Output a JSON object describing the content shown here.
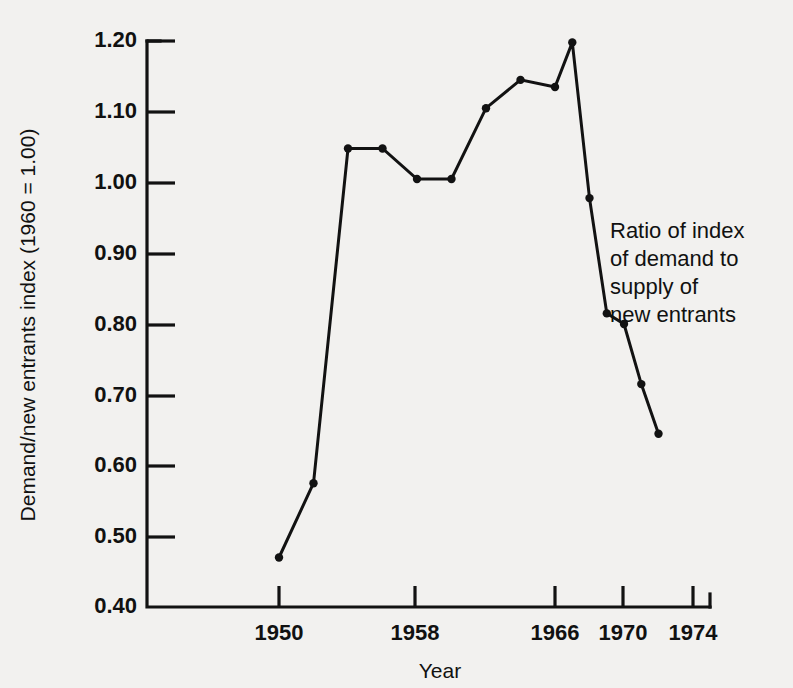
{
  "chart_data": {
    "type": "line",
    "title": "",
    "subtitle": "",
    "xlabel": "Year",
    "ylabel": "Demand/new entrants index (1960 = 1.00)",
    "xlim": [
      1946,
      1974
    ],
    "ylim": [
      0.4,
      1.2
    ],
    "grid": false,
    "legend_position": "none",
    "x_ticks": [
      1950,
      1958,
      1966,
      1970,
      1974
    ],
    "x_tick_labels": [
      "1950",
      "1958",
      "1966",
      "1970",
      "1974"
    ],
    "y_ticks": [
      0.4,
      0.5,
      0.6,
      0.7,
      0.8,
      0.9,
      1.0,
      1.1,
      1.2
    ],
    "y_tick_labels": [
      "0.40",
      "0.50",
      "0.60",
      "0.70",
      "0.80",
      "0.90",
      "1.00",
      "1.10",
      "1.20"
    ],
    "series": [
      {
        "name": "Ratio of index of demand to supply of new entrants",
        "marker": "filled-circle",
        "color": "#121212",
        "x": [
          1950,
          1952,
          1954,
          1956,
          1958,
          1960,
          1962,
          1964,
          1966,
          1967,
          1968,
          1969,
          1970,
          1971,
          1972
        ],
        "values": [
          0.47,
          0.575,
          1.048,
          1.048,
          1.005,
          1.005,
          1.105,
          1.145,
          1.135,
          1.198,
          0.978,
          0.815,
          0.8,
          0.715,
          0.645
        ]
      }
    ],
    "annotations": [
      {
        "name": "series-annotation",
        "lines": [
          "Ratio of index",
          "of demand to",
          "supply of",
          "new entrants"
        ],
        "x": 1967.5,
        "y": 0.93
      }
    ]
  },
  "axes": {
    "y_title": "Demand/new entrants index (1960 = 1.00)",
    "x_title": "Year"
  },
  "colors": {
    "background": "#f2f1ef",
    "ink": "#121212",
    "line": "#121212"
  }
}
